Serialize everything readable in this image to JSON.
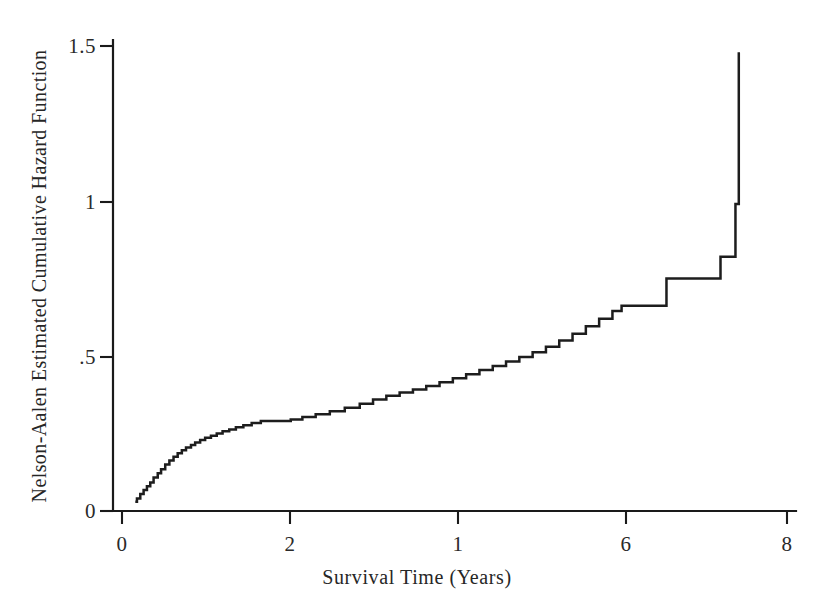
{
  "chart_data": {
    "type": "line",
    "subtype": "step-function",
    "title": "",
    "xlabel": "Survival Time (Years)",
    "ylabel": "Nelson-Aalen Estimated Cumulative Hazard Function",
    "xlim": [
      0,
      8
    ],
    "ylim": [
      0,
      1.5
    ],
    "xticks": [
      0,
      2,
      4,
      6,
      8
    ],
    "xtick_labels": [
      "0",
      "2",
      "1",
      "6",
      "8"
    ],
    "yticks": [
      0,
      0.5,
      1,
      1.5
    ],
    "ytick_labels": [
      "0",
      ".5",
      "1",
      "1.5"
    ],
    "grid": false,
    "legend": false,
    "legend_position": "none",
    "line_color": "#1d1d1d",
    "background_color": "#ffffff",
    "axis_color": "#1a1a1a",
    "series": [
      {
        "name": "Nelson-Aalen cumulative hazard",
        "step": "post",
        "x": [
          0.16,
          0.18,
          0.22,
          0.26,
          0.3,
          0.34,
          0.38,
          0.43,
          0.47,
          0.52,
          0.57,
          0.62,
          0.67,
          0.72,
          0.77,
          0.83,
          0.88,
          0.94,
          1.0,
          1.07,
          1.14,
          1.21,
          1.29,
          1.37,
          1.46,
          1.56,
          1.67,
          1.78,
          1.9,
          2.03,
          2.17,
          2.33,
          2.5,
          2.68,
          2.86,
          3.02,
          3.18,
          3.34,
          3.5,
          3.66,
          3.82,
          3.98,
          4.14,
          4.3,
          4.46,
          4.62,
          4.78,
          4.94,
          5.1,
          5.26,
          5.42,
          5.58,
          5.74,
          5.9,
          6.01,
          6.55,
          7.2,
          7.38,
          7.42
        ],
        "y": [
          0.03,
          0.04,
          0.055,
          0.068,
          0.08,
          0.092,
          0.108,
          0.122,
          0.135,
          0.15,
          0.163,
          0.175,
          0.186,
          0.196,
          0.205,
          0.213,
          0.221,
          0.229,
          0.236,
          0.243,
          0.25,
          0.257,
          0.263,
          0.27,
          0.277,
          0.284,
          0.29,
          0.29,
          0.29,
          0.295,
          0.303,
          0.312,
          0.322,
          0.333,
          0.346,
          0.36,
          0.372,
          0.382,
          0.392,
          0.403,
          0.415,
          0.428,
          0.441,
          0.455,
          0.468,
          0.482,
          0.497,
          0.512,
          0.53,
          0.55,
          0.572,
          0.596,
          0.62,
          0.645,
          0.662,
          0.75,
          0.82,
          0.99,
          1.48
        ]
      }
    ],
    "annotations": []
  },
  "figure": {
    "caption": "",
    "source_note": ""
  }
}
